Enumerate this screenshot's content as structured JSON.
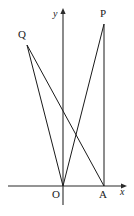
{
  "figure": {
    "kind": "coordinate-geometry-diagram",
    "background_color": "#ffffff",
    "stroke_color": "#1a1a1a",
    "axis_color": "#2b2b2b",
    "width": 134,
    "height": 216
  },
  "axes": {
    "x_axis_label": "x",
    "y_axis_label": "y",
    "origin_label": "O",
    "x_axis": {
      "x1": 8,
      "y1": 186,
      "x2": 127,
      "y2": 186,
      "arrow": "right"
    },
    "y_axis": {
      "x1": 63,
      "y1": 205,
      "x2": 63,
      "y2": 9,
      "arrow": "up"
    }
  },
  "points": [
    {
      "name": "O",
      "label": "O",
      "x": 63,
      "y": 186,
      "label_x": 52,
      "label_y": 189
    },
    {
      "name": "A",
      "label": "A",
      "x": 104,
      "y": 186,
      "label_x": 99,
      "label_y": 189
    },
    {
      "name": "P",
      "label": "P",
      "x": 104,
      "y": 24,
      "label_x": 100,
      "label_y": 8
    },
    {
      "name": "Q",
      "label": "Q",
      "x": 27,
      "y": 45,
      "label_x": 18,
      "label_y": 29
    }
  ],
  "segments": [
    {
      "name": "segment-QO",
      "from": "Q",
      "to": "O"
    },
    {
      "name": "segment-QA",
      "from": "Q",
      "to": "A"
    },
    {
      "name": "segment-OP",
      "from": "O",
      "to": "P"
    },
    {
      "name": "segment-PA",
      "from": "P",
      "to": "A"
    }
  ]
}
